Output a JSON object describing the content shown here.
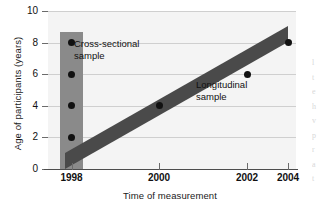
{
  "chart_data": {
    "type": "scatter",
    "title": "",
    "xlabel": "Time of measurement",
    "ylabel": "Age of participants (years)",
    "xlim": [
      1997.4,
      2004.9
    ],
    "ylim": [
      0,
      10
    ],
    "xticks": [
      1998,
      2000,
      2002,
      2004
    ],
    "xticklabels": [
      "1998",
      "2000",
      "2002",
      "2004"
    ],
    "yticks": [
      0,
      2,
      4,
      6,
      8,
      10
    ],
    "yticklabels": [
      "0",
      "2",
      "4",
      "6",
      "8",
      "10"
    ],
    "grid": "horizontal",
    "legend": "none",
    "series": [
      {
        "name": "Cross-sectional sample",
        "annotation": "Cross-sectional\nsample",
        "annotation_line1": "Cross-sectional",
        "annotation_line2": "sample",
        "shape": "vertical-band",
        "color": "#8a8a8a",
        "band_x": 1998,
        "band_y_range": [
          0,
          8.7
        ],
        "points": [
          {
            "x": 1998,
            "y": 8
          },
          {
            "x": 1998,
            "y": 6
          },
          {
            "x": 1998,
            "y": 4
          },
          {
            "x": 1998,
            "y": 2
          }
        ]
      },
      {
        "name": "Longitudinal sample",
        "annotation": "Longitudinal\nsample",
        "annotation_line1": "Longitudinal",
        "annotation_line2": "sample",
        "shape": "diagonal-band",
        "color": "#4a4a4a",
        "band_start": {
          "x": 1998,
          "y": 2
        },
        "band_end": {
          "x": 2004,
          "y": 8
        },
        "band_thickness_years": 1.0,
        "points": [
          {
            "x": 1998,
            "y": 2
          },
          {
            "x": 2000,
            "y": 4
          },
          {
            "x": 2002,
            "y": 6
          },
          {
            "x": 2004,
            "y": 8
          }
        ]
      }
    ],
    "colors": {
      "plot_background": "#f4f4f4",
      "gridline": "#cfcfcf",
      "axis": "#4d4d4d",
      "point": "#111111",
      "cross_sectional_band": "#8a8a8a",
      "longitudinal_band": "#4a4a4a"
    }
  },
  "axes": {
    "ylabel": "Age of participants (years)",
    "xlabel": "Time of measurement"
  },
  "annotations": {
    "cross_sectional_line1": "Cross-sectional",
    "cross_sectional_line2": "sample",
    "longitudinal_line1": "Longitudinal",
    "longitudinal_line2": "sample"
  },
  "page_bleed": {
    "lines": [
      "l",
      "t",
      "e",
      "h",
      "v",
      "p",
      "r",
      "",
      "a",
      "t"
    ]
  }
}
